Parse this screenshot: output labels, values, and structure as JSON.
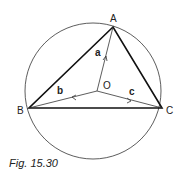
{
  "figure": {
    "caption": "Fig. 15.30",
    "points": {
      "A": "A",
      "B": "B",
      "C": "C",
      "O": "O"
    },
    "vectors": {
      "a": "a",
      "b": "b",
      "c": "c"
    },
    "colors": {
      "stroke": "#222222",
      "background": "#ffffff"
    }
  }
}
